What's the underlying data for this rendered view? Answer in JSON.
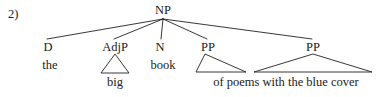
{
  "figure": {
    "item_number": "2)",
    "background_color": "#ffffff",
    "ink_color": "#212121"
  },
  "tree": {
    "root": {
      "label": "NP",
      "x": 163,
      "y": 10
    },
    "nodes": [
      {
        "id": "d",
        "label": "D",
        "x": 48,
        "y": 47,
        "triangle": false
      },
      {
        "id": "adjp",
        "label": "AdjP",
        "x": 115,
        "y": 47,
        "triangle": true
      },
      {
        "id": "n",
        "label": "N",
        "x": 160,
        "y": 47,
        "triangle": false
      },
      {
        "id": "pp1",
        "label": "PP",
        "x": 208,
        "y": 47,
        "triangle": true
      },
      {
        "id": "pp2",
        "label": "PP",
        "x": 313,
        "y": 47,
        "triangle": true
      }
    ],
    "terminals": [
      {
        "id": "the",
        "text": "the",
        "x": 50,
        "y": 63
      },
      {
        "id": "big",
        "text": "big",
        "x": 115,
        "y": 80
      },
      {
        "id": "book",
        "text": "book",
        "x": 163,
        "y": 63
      },
      {
        "id": "pp-string",
        "text": "of poems with the blue cover",
        "x": 286,
        "y": 80
      }
    ],
    "full_phrase": "the big book of poems with the blue cover"
  },
  "geometry": {
    "branches": [
      {
        "from_x": 163,
        "from_y": 19,
        "to_x": 47,
        "to_y": 39
      },
      {
        "from_x": 163,
        "from_y": 19,
        "to_x": 114,
        "to_y": 39
      },
      {
        "from_x": 163,
        "from_y": 19,
        "to_x": 161,
        "to_y": 39
      },
      {
        "from_x": 163,
        "from_y": 19,
        "to_x": 207,
        "to_y": 39
      },
      {
        "from_x": 163,
        "from_y": 19,
        "to_x": 312,
        "to_y": 39
      }
    ],
    "triangles": [
      {
        "apex_x": 115,
        "apex_y": 54,
        "left_x": 101,
        "left_y": 73,
        "right_x": 129,
        "right_y": 73
      },
      {
        "apex_x": 205,
        "apex_y": 54,
        "left_x": 196,
        "left_y": 72,
        "right_x": 246,
        "right_y": 72
      },
      {
        "apex_x": 313,
        "apex_y": 54,
        "left_x": 254,
        "left_y": 72,
        "right_x": 372,
        "right_y": 72
      }
    ]
  }
}
